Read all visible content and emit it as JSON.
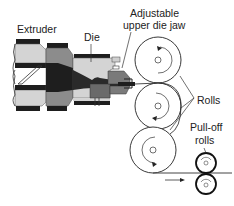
{
  "diagram": {
    "type": "process-schematic",
    "labels": {
      "extruder": "Extruder",
      "die": "Die",
      "jaw_line1": "Adjustable",
      "jaw_line2": "upper die jaw",
      "rolls": "Rolls",
      "pulloff_line1": "Pull-off",
      "pulloff_line2": "rolls"
    },
    "components": [
      {
        "id": "extruder",
        "label": "Extruder"
      },
      {
        "id": "die",
        "label": "Die"
      },
      {
        "id": "upper-die-jaw",
        "label": "Adjustable upper die jaw"
      },
      {
        "id": "rolls",
        "label": "Rolls",
        "count": 3
      },
      {
        "id": "pull-off-rolls",
        "label": "Pull-off rolls",
        "count": 2
      }
    ],
    "colors": {
      "light_gray": "#d4d4d4",
      "mid_gray": "#8c8c8c",
      "dark": "#1e1e1e",
      "outline": "#333333"
    }
  }
}
